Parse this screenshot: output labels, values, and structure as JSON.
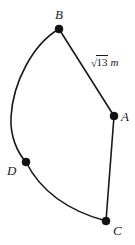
{
  "figure": {
    "canvas": {
      "width": 135,
      "height": 245,
      "background": "#ffffff"
    },
    "stroke_color": "#1a1a1a",
    "vertex_color": "#111111",
    "vertices": [
      {
        "id": "A",
        "label": "A",
        "x": 114,
        "y": 116,
        "label_x": 121,
        "label_y": 111
      },
      {
        "id": "B",
        "label": "B",
        "x": 59,
        "y": 29,
        "label_x": 55,
        "label_y": 8
      },
      {
        "id": "C",
        "label": "C",
        "x": 106,
        "y": 221,
        "label_x": 113,
        "label_y": 224
      },
      {
        "id": "D",
        "label": "D",
        "x": 26,
        "y": 162,
        "label_x": 7,
        "label_y": 164
      }
    ],
    "edges": [
      {
        "id": "BA",
        "from": "B",
        "to": "A",
        "kind": "straight",
        "label": "√13 m"
      },
      {
        "id": "AC",
        "from": "A",
        "to": "C",
        "kind": "straight",
        "label": ""
      },
      {
        "id": "BD",
        "from": "B",
        "to": "D",
        "kind": "curved",
        "label": ""
      },
      {
        "id": "DC",
        "from": "D",
        "to": "C",
        "kind": "curved",
        "label": ""
      }
    ],
    "edge_label_ba": {
      "radical": "√",
      "radicand": "13",
      "unit": "m",
      "x": 91,
      "y": 57
    }
  }
}
